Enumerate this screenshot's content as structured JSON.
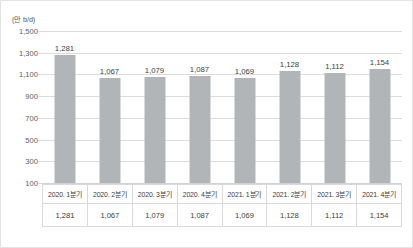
{
  "chart_data": {
    "type": "bar",
    "title": "",
    "subtitle": "",
    "unit_label": "(만 b/d)",
    "xlabel": "",
    "ylabel": "",
    "categories": [
      "2020. 1분기",
      "2020. 2분기",
      "2020. 3분기",
      "2020. 4분기",
      "2021. 1분기",
      "2021. 2분기",
      "2021. 3분기",
      "2021. 4분기"
    ],
    "values": [
      1281,
      1067,
      1079,
      1087,
      1069,
      1128,
      1112,
      1154
    ],
    "value_labels": [
      "1,281",
      "1,067",
      "1,079",
      "1,087",
      "1,069",
      "1,128",
      "1,112",
      "1,154"
    ],
    "ylim": [
      100,
      1500
    ],
    "ytick_values": [
      1500,
      1300,
      1100,
      900,
      700,
      500,
      300,
      100
    ],
    "ytick_labels": [
      "1,500",
      "1,300",
      "1,100",
      "900",
      "700",
      "500",
      "300",
      "100"
    ],
    "grid": true,
    "legend": false,
    "legend_position": "none",
    "bar_color": "#b2b5b7",
    "gridline_color": "#dcdcdc",
    "text_color": "#3c3c3c"
  },
  "table": {
    "category_row": [
      "2020. 1분기",
      "2020. 2분기",
      "2020. 3분기",
      "2020. 4분기",
      "2021. 1분기",
      "2021. 2분기",
      "2021. 3분기",
      "2021. 4분기"
    ],
    "value_row": [
      "1,281",
      "1,067",
      "1,079",
      "1,087",
      "1,069",
      "1,128",
      "1,112",
      "1,154"
    ]
  }
}
